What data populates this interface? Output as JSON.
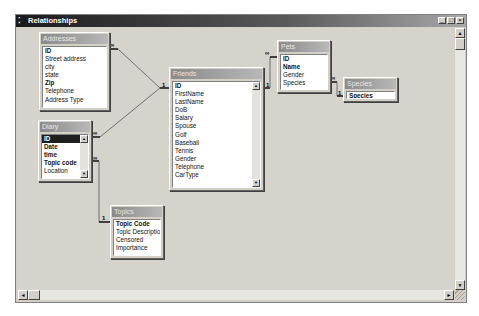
{
  "window": {
    "title": "Relationships",
    "controls": {
      "minimize": "_",
      "maximize": "□",
      "close": "×"
    }
  },
  "tables": {
    "addresses": {
      "title": "Addresses",
      "fields": [
        {
          "name": "ID",
          "key": true
        },
        {
          "name": "Street address",
          "key": false
        },
        {
          "name": "city",
          "key": false
        },
        {
          "name": "state",
          "key": false
        },
        {
          "name": "Zip",
          "key": true
        },
        {
          "name": "Telephone",
          "key": false
        },
        {
          "name": "Address Type",
          "key": false
        }
      ]
    },
    "diary": {
      "title": "Diary",
      "fields": [
        {
          "name": "ID",
          "key": true,
          "selected": true
        },
        {
          "name": "Date",
          "key": true
        },
        {
          "name": "time",
          "key": true
        },
        {
          "name": "Topic code",
          "key": true
        },
        {
          "name": "Location",
          "key": false
        }
      ]
    },
    "friends": {
      "title": "Friends",
      "fields": [
        {
          "name": "ID",
          "key": true
        },
        {
          "name": "FirstName",
          "key": false
        },
        {
          "name": "LastName",
          "key": false
        },
        {
          "name": "DoB",
          "key": false
        },
        {
          "name": "Salary",
          "key": false
        },
        {
          "name": "Spouse",
          "key": false
        },
        {
          "name": "Golf",
          "key": false
        },
        {
          "name": "Baseball",
          "key": false
        },
        {
          "name": "Tennis",
          "key": false
        },
        {
          "name": "Gender",
          "key": false
        },
        {
          "name": "Telephone",
          "key": false
        },
        {
          "name": "CarType",
          "key": false
        }
      ]
    },
    "pets": {
      "title": "Pets",
      "fields": [
        {
          "name": "ID",
          "key": true
        },
        {
          "name": "Name",
          "key": true
        },
        {
          "name": "Gender",
          "key": false
        },
        {
          "name": "Species",
          "key": false
        }
      ]
    },
    "species": {
      "title": "Species",
      "fields": [
        {
          "name": "Species",
          "key": true
        }
      ]
    },
    "topics": {
      "title": "Topics",
      "fields": [
        {
          "name": "Topic Code",
          "key": true
        },
        {
          "name": "Topic Description",
          "key": false
        },
        {
          "name": "Censored",
          "key": false
        },
        {
          "name": "Importance",
          "key": false
        }
      ]
    }
  },
  "relationships": [
    {
      "from": "Addresses",
      "to": "Friends",
      "many_label": "∞",
      "one_label": "1"
    },
    {
      "from": "Diary",
      "to": "Friends",
      "many_label": "∞",
      "one_label": "1"
    },
    {
      "from": "Pets",
      "to": "Friends",
      "many_label": "∞",
      "one_label": "1"
    },
    {
      "from": "Pets",
      "to": "Species",
      "many_label": "∞",
      "one_label": "1"
    },
    {
      "from": "Diary",
      "to": "Topics",
      "many_label": "∞",
      "one_label": "1"
    }
  ],
  "scroll_glyphs": {
    "up": "▲",
    "down": "▼",
    "left": "◄",
    "right": "►"
  }
}
